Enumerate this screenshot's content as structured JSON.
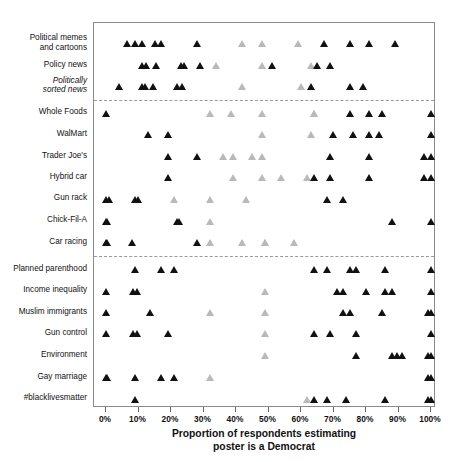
{
  "chart_data": {
    "type": "scatter",
    "title": "",
    "xlabel": "Proportion of respondents estimating poster is a Democrat",
    "xlabel_line1": "Proportion of respondents estimating",
    "xlabel_line2": "poster is a Democrat",
    "ylabel": "",
    "xlim": [
      0,
      100
    ],
    "xticks": [
      0,
      10,
      20,
      30,
      40,
      50,
      60,
      70,
      80,
      90,
      100
    ],
    "xticklabels": [
      "0%",
      "10%",
      "20%",
      "30%",
      "40%",
      "50%",
      "60%",
      "70%",
      "80%",
      "90%",
      "100%"
    ],
    "grid": false,
    "legend": "none",
    "colors": {
      "significant": "#111111",
      "nonsignificant": "#b9b9b9",
      "frame": "#8a8a8a",
      "divider": "#9a9a9a"
    },
    "marker": "triangle-up",
    "panels": [
      {
        "name": "news",
        "rows": [
          0,
          1,
          2
        ]
      },
      {
        "name": "lifestyle",
        "rows": [
          3,
          4,
          5,
          6,
          7,
          8,
          9
        ]
      },
      {
        "name": "issues",
        "rows": [
          10,
          11,
          12,
          13,
          14,
          15,
          16
        ]
      }
    ],
    "categories": [
      "Political memes\nand cartoons",
      "Policy news",
      "Politically\nsorted news",
      "Whole Foods",
      "WalMart",
      "Trader Joe's",
      "Hybrid car",
      "Gun rack",
      "Chick-Fil-A",
      "Car racing",
      "Planned parenthood",
      "Income inequality",
      "Muslim immigrants",
      "Gun control",
      "Environment",
      "Gay marriage",
      "#blacklivesmatter"
    ],
    "categories_italic": [
      2
    ],
    "rows": [
      {
        "label": "Political memes and cartoons",
        "dark": [
          6.5,
          9,
          11,
          15,
          17,
          28,
          67,
          75,
          81,
          89
        ],
        "gray": [
          42,
          48,
          59
        ]
      },
      {
        "label": "Policy news",
        "dark": [
          11,
          12.5,
          15.5,
          23,
          24,
          29,
          51,
          65,
          69
        ],
        "gray": [
          34,
          48,
          63
        ]
      },
      {
        "label": "Politically sorted news",
        "dark": [
          4,
          11,
          12,
          14.5,
          22,
          23.5,
          63,
          75,
          79
        ],
        "gray": [
          42,
          60
        ]
      },
      {
        "label": "Whole Foods",
        "dark": [
          0,
          75,
          81,
          85,
          100
        ],
        "gray": [
          32,
          38.5,
          48,
          64,
          64
        ]
      },
      {
        "label": "WalMart",
        "dark": [
          13,
          19,
          70,
          76,
          81,
          84,
          100
        ],
        "gray": [
          48,
          63
        ]
      },
      {
        "label": "Trader Joe's",
        "dark": [
          19,
          28,
          69,
          81,
          98,
          100
        ],
        "gray": [
          36,
          39,
          45,
          48
        ]
      },
      {
        "label": "Hybrid car",
        "dark": [
          19,
          64,
          69,
          81,
          98,
          100
        ],
        "gray": [
          39,
          48,
          54,
          62
        ]
      },
      {
        "label": "Gun rack",
        "dark": [
          0,
          1,
          9,
          10,
          68,
          73
        ],
        "gray": [
          21,
          32,
          43
        ]
      },
      {
        "label": "Chick-Fil-A",
        "dark": [
          0,
          0.5,
          22,
          22.5,
          88,
          100
        ],
        "gray": [
          32
        ]
      },
      {
        "label": "Car racing",
        "dark": [
          0,
          0.5,
          8,
          28
        ],
        "gray": [
          32,
          42,
          49,
          49,
          58
        ]
      },
      {
        "label": "Planned parenthood",
        "dark": [
          9,
          17,
          21,
          64,
          68,
          75,
          77,
          86,
          100
        ],
        "gray": []
      },
      {
        "label": "Income inequality",
        "dark": [
          0,
          8.5,
          9.5,
          71,
          73,
          80,
          86,
          88,
          100
        ],
        "gray": [
          49
        ]
      },
      {
        "label": "Muslim immigrants",
        "dark": [
          0,
          13.5,
          73,
          75,
          85,
          99,
          100
        ],
        "gray": [
          32,
          49
        ]
      },
      {
        "label": "Gun control",
        "dark": [
          0,
          8.5,
          9.5,
          19,
          64,
          69,
          77,
          100
        ],
        "gray": [
          49
        ]
      },
      {
        "label": "Environment",
        "dark": [
          77,
          88,
          89.5,
          91,
          99,
          100
        ],
        "gray": [
          49
        ]
      },
      {
        "label": "Gay marriage",
        "dark": [
          0,
          0.5,
          9,
          17,
          21,
          99,
          100
        ],
        "gray": [
          32
        ]
      },
      {
        "label": "#blacklivesmatter",
        "dark": [
          9,
          64,
          68,
          74,
          86,
          99,
          100
        ],
        "gray": [
          62
        ]
      }
    ]
  },
  "axis": {
    "x_title_line1": "Proportion of respondents estimating",
    "x_title_line2": "poster is a Democrat"
  }
}
